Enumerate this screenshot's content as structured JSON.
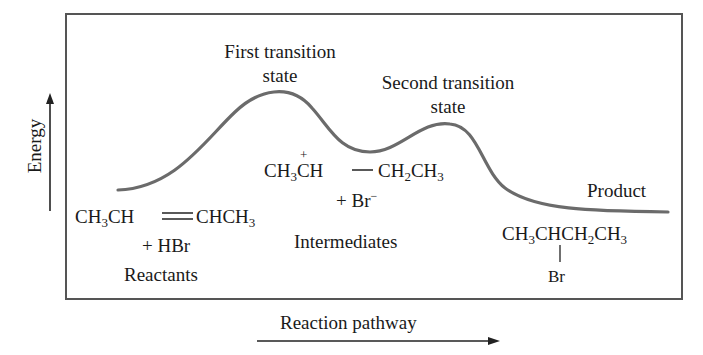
{
  "diagram": {
    "type": "reaction-energy-profile",
    "axes": {
      "y_label": "Energy",
      "x_label": "Reaction pathway"
    },
    "labels": {
      "first_ts_line1": "First transition",
      "first_ts_line2": "state",
      "second_ts_line1": "Second transition",
      "second_ts_line2": "state",
      "product_label": "Product",
      "reactants_label": "Reactants",
      "intermediates_label": "Intermediates"
    },
    "reactants": {
      "formula_left": "CH3CH",
      "formula_right": "CHCH3",
      "bond": "double",
      "plus": "+ HBr"
    },
    "intermediates": {
      "formula_left": "CH3CH",
      "charge": "+",
      "formula_right": "CH2CH3",
      "plus": "+ Br−"
    },
    "product": {
      "formula": "CH3CHCH2CH3",
      "substituent": "Br"
    },
    "curve_points": [
      {
        "stage": "reactants",
        "relative_energy": "medium"
      },
      {
        "stage": "first transition state",
        "relative_energy": "highest"
      },
      {
        "stage": "intermediates",
        "relative_energy": "local minimum"
      },
      {
        "stage": "second transition state",
        "relative_energy": "high"
      },
      {
        "stage": "product",
        "relative_energy": "lowest"
      }
    ],
    "colors": {
      "curve": "#6b6b6b",
      "frame": "#555555",
      "text": "#1a1a1a"
    }
  }
}
